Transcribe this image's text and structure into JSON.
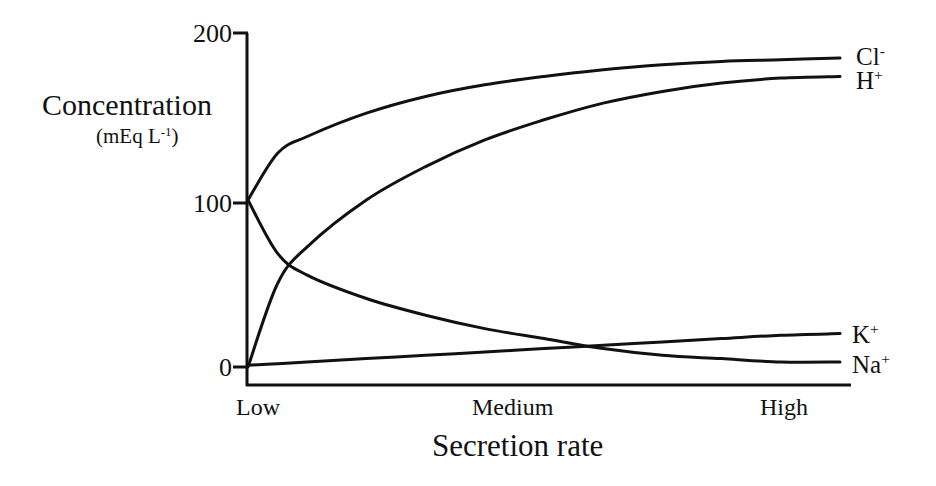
{
  "chart_data": {
    "type": "line",
    "title": "",
    "xlabel": "Secretion rate",
    "ylabel": "Concentration",
    "ylabel_unit": "(mEq L",
    "ylabel_unit_sup": "-1",
    "ylabel_unit_close": ")",
    "ylim": [
      0,
      200
    ],
    "yticks": [
      0,
      100,
      200
    ],
    "ytick_labels": [
      "0",
      "100",
      "200"
    ],
    "x_categories": [
      "Low",
      "Medium",
      "High"
    ],
    "grid": false,
    "legend_position": "inline-right",
    "x": [
      0,
      0.05,
      0.1,
      0.2,
      0.3,
      0.4,
      0.5,
      0.6,
      0.7,
      0.8,
      0.9,
      1.0
    ],
    "series": [
      {
        "name": "Cl-",
        "label_base": "Cl",
        "label_sup": "-",
        "values": [
          100,
          128,
          138,
          152,
          162,
          169,
          174,
          178,
          181,
          183,
          184,
          185
        ]
      },
      {
        "name": "H+",
        "label_base": "H",
        "label_sup": "+",
        "values": [
          0,
          50,
          72,
          100,
          120,
          136,
          148,
          158,
          165,
          170,
          173,
          174
        ]
      },
      {
        "name": "K+",
        "label_base": "K",
        "label_sup": "+",
        "values": [
          1,
          2,
          3,
          5,
          7,
          9,
          11,
          13,
          15,
          17,
          19,
          20
        ]
      },
      {
        "name": "Na+",
        "label_base": "Na",
        "label_sup": "+",
        "values": [
          100,
          68,
          55,
          41,
          31,
          23,
          17,
          11,
          7,
          5,
          3,
          3
        ]
      }
    ]
  },
  "labels": {
    "y_200": "200",
    "y_100": "100",
    "y_0": "0",
    "x_low": "Low",
    "x_medium": "Medium",
    "x_high": "High"
  },
  "style": {
    "line_color": "#111111",
    "background": "#ffffff"
  }
}
